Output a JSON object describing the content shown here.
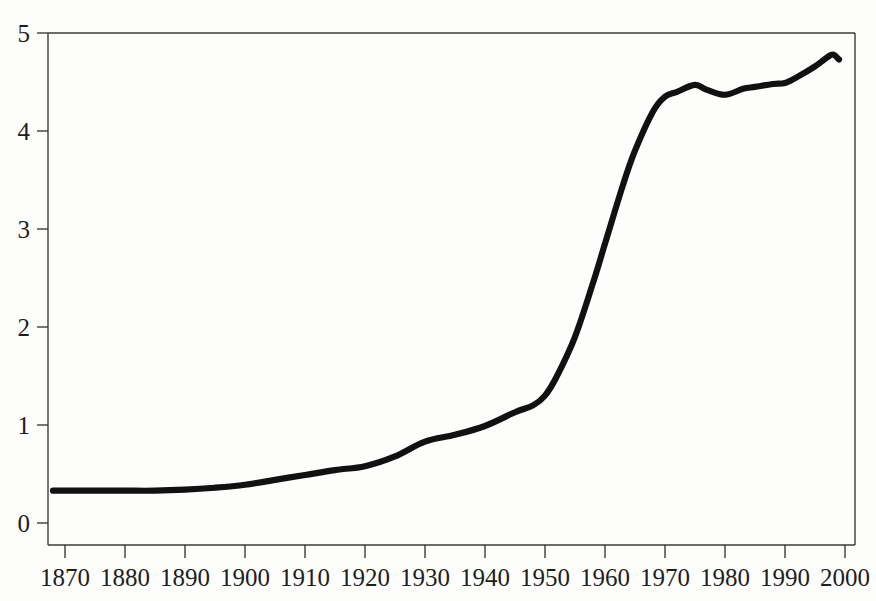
{
  "chart_data": {
    "type": "line",
    "title": "",
    "xlabel": "",
    "ylabel": "",
    "xlim": [
      1866,
      2003
    ],
    "ylim": [
      0,
      5
    ],
    "grid": false,
    "legend": null,
    "x_ticks": [
      1870,
      1880,
      1890,
      1900,
      1910,
      1920,
      1930,
      1940,
      1950,
      1960,
      1970,
      1980,
      1990,
      2000
    ],
    "y_ticks": [
      0,
      1,
      2,
      3,
      4,
      5
    ],
    "line_color": "#111111",
    "series": [
      {
        "name": "series-1",
        "x": [
          1868,
          1870,
          1875,
          1880,
          1885,
          1890,
          1895,
          1900,
          1905,
          1910,
          1915,
          1920,
          1925,
          1930,
          1935,
          1940,
          1945,
          1948,
          1950,
          1952,
          1955,
          1958,
          1960,
          1963,
          1965,
          1968,
          1970,
          1972,
          1975,
          1977,
          1980,
          1983,
          1985,
          1988,
          1990,
          1992,
          1995,
          1997,
          1998,
          1999
        ],
        "values": [
          0.33,
          0.33,
          0.33,
          0.33,
          0.33,
          0.34,
          0.36,
          0.39,
          0.44,
          0.49,
          0.54,
          0.58,
          0.68,
          0.83,
          0.9,
          0.99,
          1.13,
          1.2,
          1.3,
          1.5,
          1.9,
          2.45,
          2.85,
          3.45,
          3.8,
          4.2,
          4.35,
          4.4,
          4.47,
          4.42,
          4.37,
          4.43,
          4.45,
          4.48,
          4.49,
          4.55,
          4.66,
          4.75,
          4.78,
          4.73
        ]
      }
    ]
  },
  "axes": {
    "y_tick_labels": [
      "0",
      "1",
      "2",
      "3",
      "4",
      "5"
    ],
    "x_tick_labels": [
      "1870",
      "1880",
      "1890",
      "1900",
      "1910",
      "1920",
      "1930",
      "1940",
      "1950",
      "1960",
      "1970",
      "1980",
      "1990",
      "2000"
    ]
  }
}
